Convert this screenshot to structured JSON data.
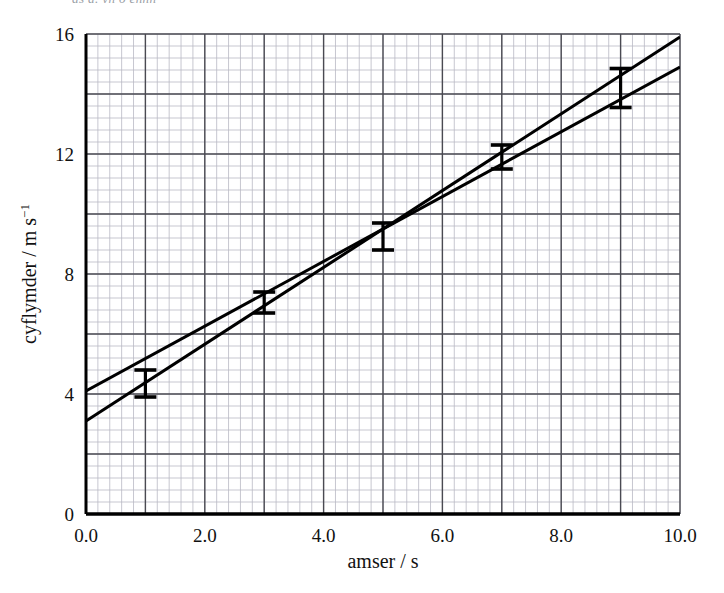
{
  "figure": {
    "clipped_top_text": "as a. yn o ennn",
    "background_color": "#ffffff",
    "ink_color": "#000000",
    "minor_grid_color": "#b9b9c4",
    "major_grid_color": "#4a4a52"
  },
  "chart_data": {
    "type": "scatter",
    "title": "",
    "xlabel": "amser / s",
    "ylabel": "cyflymder / m s⁻¹",
    "ylabel_text": "cyflymder / m s",
    "ylabel_exponent": "−1",
    "xlim": [
      0.0,
      10.0
    ],
    "ylim": [
      0,
      16
    ],
    "xticks": [
      0.0,
      2.0,
      4.0,
      6.0,
      8.0,
      10.0
    ],
    "xtick_labels": [
      "0.0",
      "2.0",
      "4.0",
      "6.0",
      "8.0",
      "10.0"
    ],
    "yticks": [
      0,
      4,
      8,
      12,
      16
    ],
    "ytick_labels": [
      "0",
      "4",
      "8",
      "12",
      "16"
    ],
    "grid": true,
    "grid_minor_x_step": 0.2,
    "grid_minor_y_step": 0.4,
    "grid_major_x_step": 1.0,
    "grid_major_y_step": 2.0,
    "legend": "none",
    "x": [
      1.0,
      3.0,
      5.0,
      7.0,
      9.0
    ],
    "values": [
      4.35,
      7.05,
      9.25,
      11.9,
      14.2
    ],
    "yerr": [
      0.45,
      0.35,
      0.45,
      0.4,
      0.65
    ],
    "series": [
      {
        "name": "data points with error bars",
        "type": "errorbar",
        "x": [
          1.0,
          3.0,
          5.0,
          7.0,
          9.0
        ],
        "y": [
          4.35,
          7.05,
          9.25,
          11.9,
          14.2
        ],
        "yerr": [
          0.45,
          0.35,
          0.45,
          0.4,
          0.65
        ],
        "ylow": [
          3.9,
          6.7,
          8.8,
          11.5,
          13.55
        ],
        "yhigh": [
          4.8,
          7.4,
          9.7,
          12.3,
          14.85
        ]
      },
      {
        "name": "line of best fit (upper, shallower)",
        "type": "line",
        "x": [
          0.0,
          10.0
        ],
        "y": [
          4.1,
          14.9
        ],
        "intercept": 4.1,
        "slope": 1.08
      },
      {
        "name": "line of maximum gradient (steeper)",
        "type": "line",
        "x": [
          0.0,
          10.0
        ],
        "y": [
          3.1,
          15.9
        ],
        "intercept": 3.1,
        "slope": 1.28
      }
    ]
  }
}
